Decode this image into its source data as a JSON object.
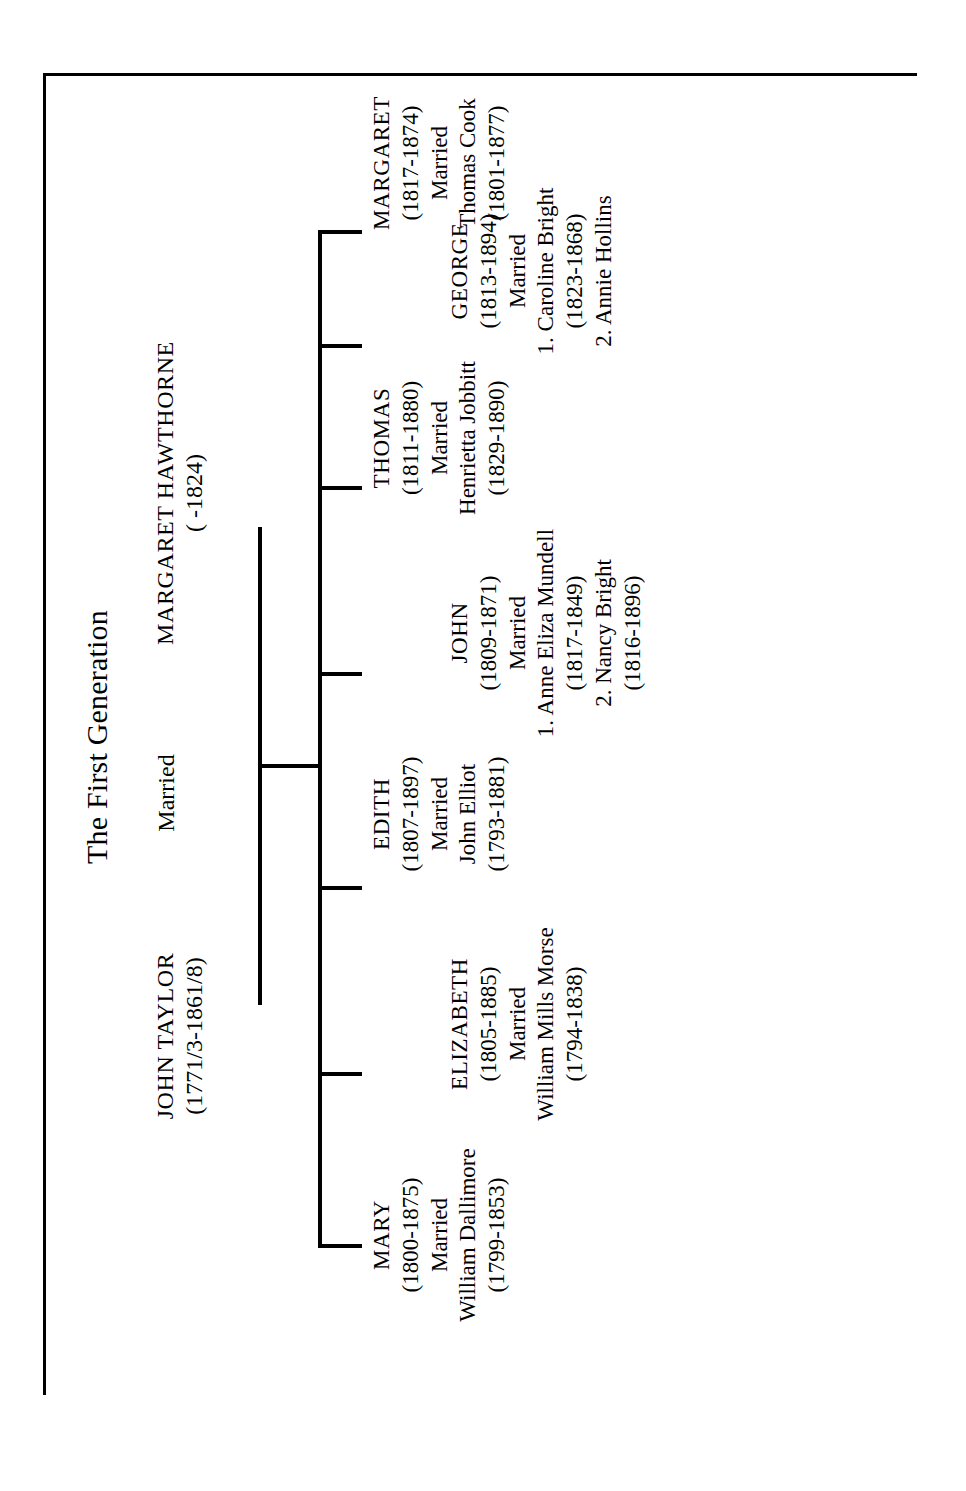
{
  "chart": {
    "title": "The First Generation",
    "married_label": "Married",
    "father": {
      "name": "JOHN TAYLOR",
      "dates": "(1771/3-1861/8)"
    },
    "mother": {
      "name": "MARGARET HAWTHORNE",
      "dates": "(          -1824)"
    },
    "children": [
      {
        "name": "MARY",
        "dates": "(1800-1875)",
        "married": "Married",
        "spouse": "William Dallimore",
        "spouse_dates": "(1799-1853)"
      },
      {
        "name": "ELIZABETH",
        "dates": "(1805-1885)",
        "married": "Married",
        "spouse": "William Mills Morse",
        "spouse_dates": "(1794-1838)"
      },
      {
        "name": "EDITH",
        "dates": "(1807-1897)",
        "married": "Married",
        "spouse": "John Elliot",
        "spouse_dates": "(1793-1881)"
      },
      {
        "name": "JOHN",
        "dates": "(1809-1871)",
        "married": "Married",
        "spouse_1": "1. Anne Eliza Mundell",
        "spouse_1_dates": "(1817-1849)",
        "spouse_2": "2. Nancy Bright",
        "spouse_2_dates": "(1816-1896)"
      },
      {
        "name": "THOMAS",
        "dates": "(1811-1880)",
        "married": "Married",
        "spouse": "Henrietta Jobbitt",
        "spouse_dates": "(1829-1890)"
      },
      {
        "name": "GEORGE",
        "dates": "(1813-1894)",
        "married": "Married",
        "spouse_1": "1. Caroline Bright",
        "spouse_1_dates": "(1823-1868)",
        "spouse_2": "2. Annie Hollins"
      },
      {
        "name": "MARGARET",
        "dates": "(1817-1874)",
        "married": "Married",
        "spouse": "Thomas Cook",
        "spouse_dates": "(1801-1877)"
      }
    ]
  },
  "style": {
    "ink_color": "#000000",
    "page_color": "#ffffff"
  }
}
